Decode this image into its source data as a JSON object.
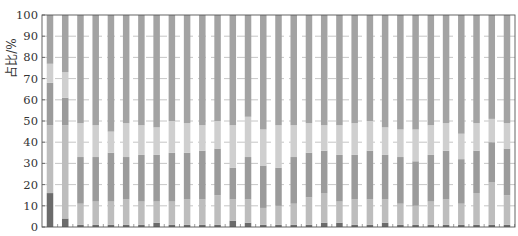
{
  "chart_data": {
    "type": "bar",
    "stacked": true,
    "title": "",
    "xlabel": "",
    "ylabel": "占比/%",
    "ylim": [
      0,
      100
    ],
    "yticks": [
      0,
      10,
      20,
      30,
      40,
      50,
      60,
      70,
      80,
      90,
      100
    ],
    "grid": "horizontal dashed",
    "legend": "none visible",
    "categories": [
      "1",
      "2",
      "3",
      "4",
      "5",
      "6",
      "7",
      "8",
      "9",
      "10",
      "11",
      "12",
      "13",
      "14",
      "15",
      "16",
      "17",
      "18",
      "19",
      "20",
      "21",
      "22",
      "23",
      "24",
      "25",
      "26",
      "27",
      "28",
      "29",
      "30",
      "31"
    ],
    "series": [
      {
        "name": "Segment 1 (dark)",
        "color": "#6b6b6b",
        "values": [
          16,
          4,
          1,
          1,
          1,
          1,
          1,
          2,
          1,
          1,
          1,
          1,
          3,
          2,
          1,
          1,
          1,
          1,
          2,
          2,
          1,
          1,
          2,
          1,
          1,
          1,
          1,
          1,
          1,
          1,
          1
        ]
      },
      {
        "name": "Segment 2 (light gray)",
        "color": "#bdbdbd",
        "values": [
          32,
          44,
          10,
          11,
          11,
          12,
          11,
          10,
          11,
          12,
          12,
          14,
          10,
          11,
          8,
          9,
          10,
          13,
          14,
          10,
          12,
          12,
          11,
          10,
          9,
          11,
          12,
          10,
          15,
          20,
          14
        ]
      },
      {
        "name": "Segment 3 (mid gray)",
        "color": "#9b9b9b",
        "values": [
          20,
          13,
          22,
          21,
          23,
          20,
          22,
          22,
          23,
          22,
          23,
          22,
          15,
          20,
          20,
          18,
          22,
          21,
          20,
          22,
          21,
          23,
          21,
          22,
          21,
          22,
          23,
          21,
          20,
          19,
          22
        ]
      },
      {
        "name": "Segment 4 (light)",
        "color": "#cfcfcf",
        "values": [
          9,
          12,
          16,
          15,
          10,
          16,
          14,
          13,
          15,
          14,
          12,
          13,
          20,
          19,
          17,
          20,
          15,
          14,
          12,
          14,
          15,
          14,
          13,
          13,
          15,
          14,
          13,
          12,
          13,
          11,
          12
        ]
      },
      {
        "name": "Segment 5 (top mid gray)",
        "color": "#a3a3a3",
        "values": [
          23,
          27,
          51,
          52,
          55,
          51,
          52,
          53,
          50,
          51,
          52,
          50,
          52,
          48,
          54,
          52,
          52,
          51,
          52,
          52,
          51,
          50,
          53,
          54,
          54,
          52,
          51,
          56,
          51,
          49,
          51
        ]
      }
    ]
  },
  "axis": {
    "ylabel": "占比/%",
    "ytick_labels": [
      "0",
      "10",
      "20",
      "30",
      "40",
      "50",
      "60",
      "70",
      "80",
      "90",
      "100"
    ]
  }
}
